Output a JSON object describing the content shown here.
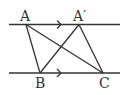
{
  "diagram": {
    "type": "geometry",
    "stroke_color": "#333333",
    "lines": {
      "top": {
        "x1": 9,
        "y1": 24.5,
        "x2": 120,
        "y2": 24.5,
        "arrow_x": 60
      },
      "bottom": {
        "x1": 9,
        "y1": 73,
        "x2": 120,
        "y2": 73,
        "arrow_x": 60
      }
    },
    "points": {
      "A": {
        "label": "A",
        "x": 26,
        "y": 24.5
      },
      "A_prime": {
        "label": "A′",
        "x": 79,
        "y": 24.5
      },
      "B": {
        "label": "B",
        "x": 40,
        "y": 73
      },
      "C": {
        "label": "C",
        "x": 103,
        "y": 73
      }
    },
    "segments": [
      [
        "A",
        "B"
      ],
      [
        "A",
        "C"
      ],
      [
        "A_prime",
        "B"
      ],
      [
        "A_prime",
        "C"
      ]
    ]
  }
}
